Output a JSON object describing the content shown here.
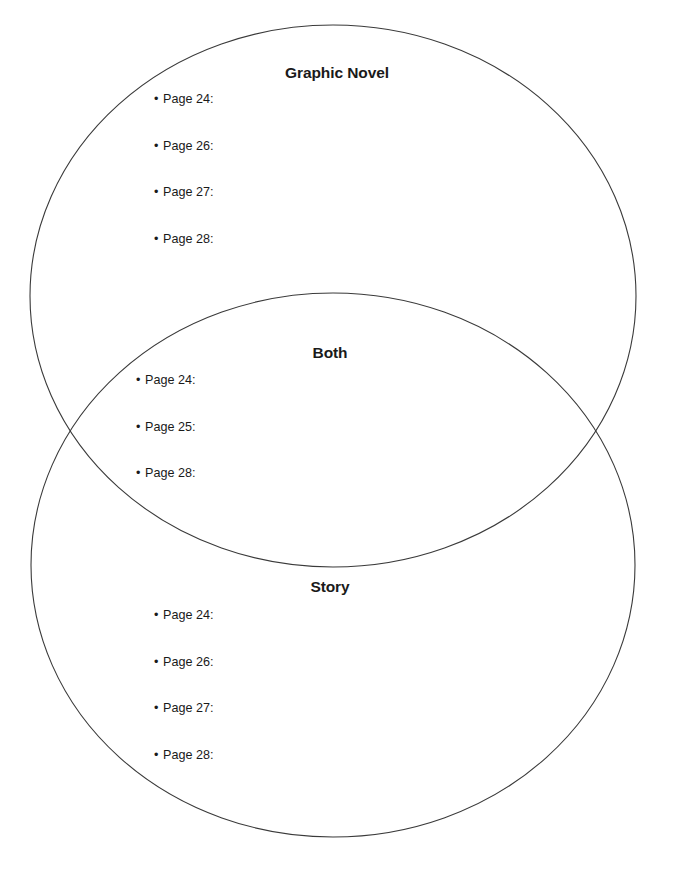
{
  "page": {
    "background_color": "#ffffff",
    "width": 674,
    "height": 877,
    "stroke_color": "#3a3a3a",
    "text_color": "#1a1a1a"
  },
  "diagram": {
    "type": "venn",
    "shape": "two-overlapping-ellipses",
    "ellipses": [
      {
        "name": "graphic-novel-ellipse",
        "cx": 333,
        "cy": 296,
        "rx": 303,
        "ry": 271
      },
      {
        "name": "story-ellipse",
        "cx": 333,
        "cy": 565,
        "rx": 302,
        "ry": 272
      }
    ]
  },
  "regions": [
    {
      "id": "graphic-novel",
      "title": "Graphic Novel",
      "items": [
        {
          "bullet": "•",
          "label": "Page 24:"
        },
        {
          "bullet": "•",
          "label": "Page 26:"
        },
        {
          "bullet": "•",
          "label": "Page 27:"
        },
        {
          "bullet": "•",
          "label": "Page 28:"
        }
      ]
    },
    {
      "id": "both",
      "title": "Both",
      "items": [
        {
          "bullet": "•",
          "label": "Page 24:"
        },
        {
          "bullet": "•",
          "label": "Page 25:"
        },
        {
          "bullet": "•",
          "label": "Page 28:"
        }
      ]
    },
    {
      "id": "story",
      "title": "Story",
      "items": [
        {
          "bullet": "•",
          "label": "Page 24:"
        },
        {
          "bullet": "•",
          "label": "Page 26:"
        },
        {
          "bullet": "•",
          "label": "Page 27:"
        },
        {
          "bullet": "•",
          "label": "Page 28:"
        }
      ]
    }
  ]
}
